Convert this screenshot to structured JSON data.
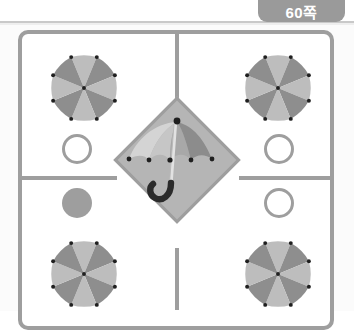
{
  "page": {
    "tab_label": "60쪽",
    "sheet_background": "#fbfbfb",
    "frame_color": "#9e9e9e",
    "paper_color": "#ffffff"
  },
  "colors": {
    "tab_background": "#9a9a9a",
    "tab_text": "#ffffff",
    "frame_line": "#9e9e9e",
    "diamond_fill": "#b5b5b5",
    "diamond_border": "#9e9e9e",
    "umbrella_panel_light": "#bdbdbd",
    "umbrella_panel_dark": "#8e8e8e",
    "center_panel_lightest": "#d4d4d4",
    "center_panel_light": "#c2c2c2",
    "center_panel_mid": "#a8a8a8",
    "center_panel_dark": "#8c8c8c",
    "handle_color": "#2b2b2b",
    "shaft_color": "#e0e0e0",
    "tip_dot_color": "#1f1f1f"
  },
  "layout": {
    "grid_rows": 2,
    "grid_columns": 2,
    "divider_thickness_px": 4,
    "frame_corner_radius_px": 10
  },
  "elements": {
    "corner_umbrellas": [
      {
        "position": "top-left",
        "view": "top-down",
        "panel_count": 8
      },
      {
        "position": "top-right",
        "view": "top-down",
        "panel_count": 8
      },
      {
        "position": "bottom-left",
        "view": "top-down",
        "panel_count": 8
      },
      {
        "position": "bottom-right",
        "view": "top-down",
        "panel_count": 8
      }
    ],
    "center_umbrella": {
      "view": "side",
      "canopy_panels": 4,
      "has_hooked_handle": true,
      "tip_dots": 5,
      "inside_diamond": true
    },
    "circle_markers": [
      {
        "position": "left-upper",
        "style": "outline"
      },
      {
        "position": "left-lower",
        "style": "filled"
      },
      {
        "position": "right-upper",
        "style": "outline"
      },
      {
        "position": "right-lower",
        "style": "outline"
      }
    ]
  }
}
